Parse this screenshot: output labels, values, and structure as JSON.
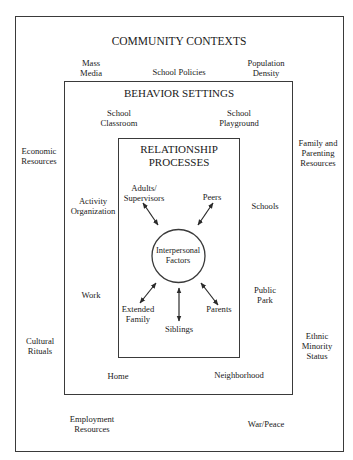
{
  "community_contexts": {
    "title": "COMMUNITY CONTEXTS",
    "items": {
      "mass_media": "Mass\nMedia",
      "school_policies": "School Policies",
      "population_density": "Population\nDensity",
      "economic_resources": "Economic\nResources",
      "family_parenting_resources": "Family and\nParenting\nResources",
      "cultural_rituals": "Cultural\nRituals",
      "ethnic_minority_status": "Ethnic\nMinority\nStatus",
      "employment_resources": "Employment\nResources",
      "war_peace": "War/Peace"
    }
  },
  "behavior_settings": {
    "title": "BEHAVIOR SETTINGS",
    "items": {
      "school_classroom": "School\nClassroom",
      "school_playground": "School\nPlayground",
      "activity_organization": "Activity\nOrganization",
      "schools": "Schools",
      "work": "Work",
      "public_park": "Public\nPark",
      "home": "Home",
      "neighborhood": "Neighborhood"
    }
  },
  "relationship_processes": {
    "title": "RELATIONSHIP\nPROCESSES",
    "center": "Interpersonal\nFactors",
    "items": {
      "adults_supervisors": "Adults/\nSupervisors",
      "peers": "Peers",
      "extended_family": "Extended\nFamily",
      "siblings": "Siblings",
      "parents": "Parents"
    },
    "arrows": [
      {
        "from": "adults_supervisors",
        "to": "center",
        "type": "bidirectional"
      },
      {
        "from": "peers",
        "to": "center",
        "type": "bidirectional"
      },
      {
        "from": "extended_family",
        "to": "center",
        "type": "bidirectional"
      },
      {
        "from": "siblings",
        "to": "center",
        "type": "bidirectional"
      },
      {
        "from": "parents",
        "to": "center",
        "type": "bidirectional"
      }
    ]
  },
  "colors": {
    "line": "#3a3a3a",
    "text": "#1a1a1a",
    "background": "#ffffff"
  }
}
